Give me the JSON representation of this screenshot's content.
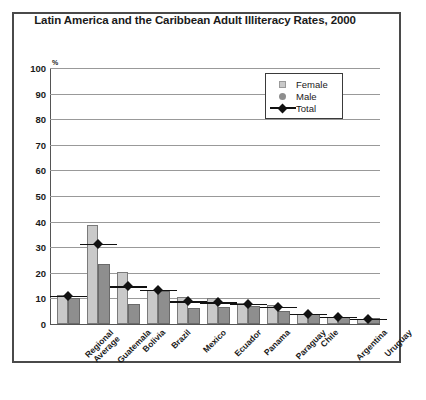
{
  "chart_data": {
    "type": "bar",
    "title": "Latin America and the Caribbean Adult Illiteracy Rates, 2000",
    "xlabel": "",
    "ylabel": "",
    "y_unit": "%",
    "ylim": [
      0,
      100
    ],
    "yticks": [
      0,
      10,
      20,
      30,
      40,
      50,
      60,
      70,
      80,
      90,
      100
    ],
    "ytick_labels": [
      "0",
      "10",
      "20",
      "30",
      "40",
      "50",
      "60",
      "70",
      "80",
      "90",
      "100"
    ],
    "grid": true,
    "legend_position": "upper-right",
    "categories": [
      "Regional\nAverage",
      "Guatemala",
      "Bolivia",
      "Brazil",
      "Mexico",
      "Ecuador",
      "Panama",
      "Paraguay",
      "Chile",
      "Argentina",
      "Uruguay"
    ],
    "series": [
      {
        "name": "Female",
        "kind": "bar",
        "color": "#c9c9c9",
        "values": [
          11.5,
          38.8,
          20.5,
          13.2,
          10.6,
          10.0,
          8.3,
          7.4,
          4.1,
          2.9,
          1.8
        ]
      },
      {
        "name": "Male",
        "kind": "bar",
        "color": "#8e8e8e",
        "values": [
          10.0,
          23.6,
          7.8,
          12.9,
          6.4,
          6.5,
          7.2,
          5.1,
          3.8,
          2.8,
          2.2
        ]
      },
      {
        "name": "Total",
        "kind": "marker",
        "color": "#111111",
        "values": [
          11.0,
          31.4,
          14.8,
          13.3,
          8.9,
          8.5,
          8.0,
          6.7,
          4.0,
          2.9,
          2.0
        ]
      }
    ]
  },
  "legend": {
    "items": [
      {
        "label": "Female",
        "icon": "square-swatch-icon"
      },
      {
        "label": "Male",
        "icon": "circle-swatch-icon"
      },
      {
        "label": "Total",
        "icon": "diamond-line-swatch-icon"
      }
    ]
  }
}
